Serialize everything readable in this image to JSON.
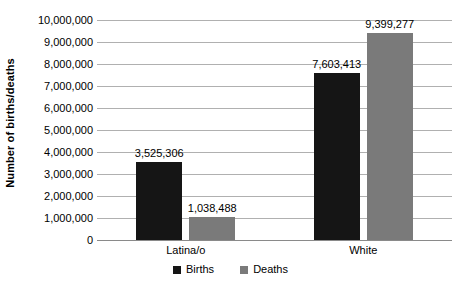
{
  "chart_data": {
    "type": "bar",
    "title": "",
    "xlabel": "",
    "ylabel": "Number of births/deaths",
    "ylim": [
      0,
      10000000
    ],
    "grid": true,
    "legend_position": "bottom",
    "categories": [
      "Latina/o",
      "White"
    ],
    "tick_labels": [
      "10,000,000",
      "9,000,000",
      "8,000,000",
      "7,000,000",
      "6,000,000",
      "5,000,000",
      "4,000,000",
      "3,000,000",
      "2,000,000",
      "1,000,000",
      "0"
    ],
    "tick_values": [
      10000000,
      9000000,
      8000000,
      7000000,
      6000000,
      5000000,
      4000000,
      3000000,
      2000000,
      1000000,
      0
    ],
    "series": [
      {
        "name": "Births",
        "color": "#151515",
        "values": [
          3525306,
          7603413
        ],
        "data_labels": [
          "3,525,306",
          "7,603,413"
        ]
      },
      {
        "name": "Deaths",
        "color": "#7a7a7a",
        "values": [
          1038488,
          9399277
        ],
        "data_labels": [
          "1,038,488",
          "9,399,277"
        ]
      }
    ]
  },
  "legend": {
    "items": [
      {
        "label": "Births",
        "color": "#151515"
      },
      {
        "label": "Deaths",
        "color": "#7a7a7a"
      }
    ]
  }
}
